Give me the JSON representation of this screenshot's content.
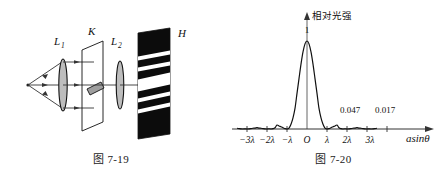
{
  "figures": {
    "left": {
      "caption": "图 7-19",
      "labels": {
        "lens1": "L",
        "lens1_sub": "1",
        "slit": "K",
        "lens2": "L",
        "lens2_sub": "2",
        "screen": "H"
      },
      "icon_names": {
        "source": "point-source-icon",
        "rays": "light-ray-arrow-icon",
        "lens1": "convex-lens-icon",
        "slit_plane": "slit-plane-icon",
        "slit_aperture": "slit-aperture-icon",
        "lens2": "convex-lens-icon",
        "screen": "diffraction-screen-icon"
      }
    },
    "right": {
      "caption": "图 7-20",
      "y_axis_label": "相对光强",
      "x_axis_label": "asinθ",
      "origin_label": "O",
      "peak_label": "1",
      "side_peak_1": "0.047",
      "side_peak_2": "0.017",
      "x_ticks": [
        "−3λ",
        "−2λ",
        "−λ",
        "O",
        "λ",
        "2λ",
        "3λ"
      ]
    }
  },
  "chart_data": {
    "type": "line",
    "xlabel": "asinθ",
    "ylabel": "相对光强",
    "xlim": [
      -3.5,
      3.5
    ],
    "ylim": [
      0,
      1.08
    ],
    "grid": false,
    "legend": null,
    "x_tick_values": [
      -3,
      -2,
      -1,
      0,
      1,
      2,
      3
    ],
    "x_tick_labels": [
      "−3λ",
      "−2λ",
      "−λ",
      "O",
      "λ",
      "2λ",
      "3λ"
    ],
    "annotations": [
      {
        "x": 0,
        "y": 1.0,
        "text": "1"
      },
      {
        "x": 1.43,
        "y": 0.047,
        "text": "0.047"
      },
      {
        "x": 2.46,
        "y": 0.017,
        "text": "0.017"
      }
    ],
    "function": "sinc^2  I/I0 = (sin(pi*u)/(pi*u))^2, u = a sin(theta)/lambda",
    "series": [
      {
        "name": "relative intensity",
        "x": [
          -3.5,
          -3.4,
          -3.3,
          -3.2,
          -3.1,
          -3.0,
          -2.9,
          -2.8,
          -2.7,
          -2.6,
          -2.5,
          -2.4,
          -2.3,
          -2.2,
          -2.1,
          -2.0,
          -1.9,
          -1.8,
          -1.7,
          -1.6,
          -1.5,
          -1.4,
          -1.3,
          -1.2,
          -1.1,
          -1.0,
          -0.9,
          -0.8,
          -0.7,
          -0.6,
          -0.5,
          -0.4,
          -0.3,
          -0.2,
          -0.1,
          0.0,
          0.1,
          0.2,
          0.3,
          0.4,
          0.5,
          0.6,
          0.7,
          0.8,
          0.9,
          1.0,
          1.1,
          1.2,
          1.3,
          1.4,
          1.5,
          1.6,
          1.7,
          1.8,
          1.9,
          2.0,
          2.1,
          2.2,
          2.3,
          2.4,
          2.5,
          2.6,
          2.7,
          2.8,
          2.9,
          3.0,
          3.1,
          3.2,
          3.3,
          3.4,
          3.5
        ],
        "y": [
          0.0083,
          0.0046,
          0.0012,
          0.0,
          0.0009,
          0.0,
          0.0012,
          0.0046,
          0.0083,
          0.0106,
          0.0162,
          0.0106,
          0.0083,
          0.0046,
          0.0012,
          0.0,
          0.0028,
          0.0,
          0.0036,
          0.0144,
          0.045,
          0.0337,
          0.0262,
          0.015,
          0.0047,
          0.0,
          0.0109,
          0.0547,
          0.1271,
          0.2339,
          0.4053,
          0.5728,
          0.7368,
          0.8751,
          0.9675,
          1.0,
          0.9675,
          0.8751,
          0.7368,
          0.5728,
          0.4053,
          0.2339,
          0.1271,
          0.0547,
          0.0109,
          0.0,
          0.0047,
          0.015,
          0.0262,
          0.0337,
          0.045,
          0.0144,
          0.0036,
          0.0,
          0.0028,
          0.0,
          0.0012,
          0.0046,
          0.0083,
          0.0106,
          0.0162,
          0.0106,
          0.0083,
          0.0046,
          0.0012,
          0.0,
          0.0009,
          0.0,
          0.0012,
          0.0046,
          0.0083
        ]
      }
    ]
  }
}
